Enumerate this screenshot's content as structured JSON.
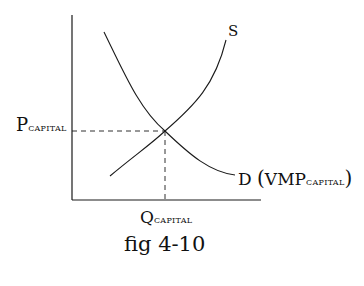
{
  "diagram": {
    "supply_label": "S",
    "demand_label": "D",
    "demand_paren_open": "(",
    "demand_vmp": "VMP",
    "demand_sub": "CAPITAL",
    "demand_paren_close": ")",
    "price_main": "P",
    "price_sub": "CAPITAL",
    "quantity_main": "Q",
    "quantity_sub": "CAPITAL",
    "caption": "fig 4-10",
    "line_color": "#1a1a1a"
  }
}
